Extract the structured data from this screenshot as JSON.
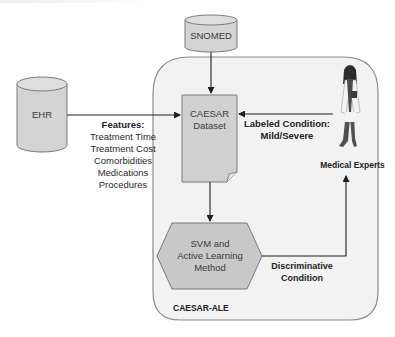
{
  "diagram": {
    "container": {
      "label": "CAESAR-ALE",
      "fill": "#f2f2f2",
      "stroke": "#8a8a8a"
    },
    "nodes": {
      "snomed": {
        "label": "SNOMED",
        "shape": "cylinder",
        "fill": "#d4d4d4"
      },
      "ehr": {
        "label": "EHR",
        "shape": "cylinder",
        "fill": "#d4d4d4"
      },
      "dataset": {
        "line1": "CAESAR",
        "line2": "Dataset",
        "shape": "document",
        "fill": "#d0d0d0"
      },
      "method": {
        "line1": "SVM and",
        "line2": "Active Learning",
        "line3": "Method",
        "shape": "hexagon",
        "fill": "#c8c8c8"
      },
      "experts": {
        "label": "Medical Experts",
        "icon": "doctor-figure-icon"
      }
    },
    "edges": {
      "snomed_to_dataset": {
        "label": ""
      },
      "ehr_to_dataset": {
        "title": "Features:",
        "items": [
          "Treatment Time",
          "Treatment Cost",
          "Comorbidities",
          "Medications",
          "Procedures"
        ]
      },
      "experts_to_dataset": {
        "line1": "Labeled Condition:",
        "line2": "Mild/Severe"
      },
      "dataset_to_method": {
        "label": ""
      },
      "method_to_experts": {
        "line1": "Discriminative",
        "line2": "Condition"
      }
    },
    "colors": {
      "line": "#1e1e1e",
      "node_stroke": "#7a7a7a",
      "text": "#333333"
    }
  }
}
